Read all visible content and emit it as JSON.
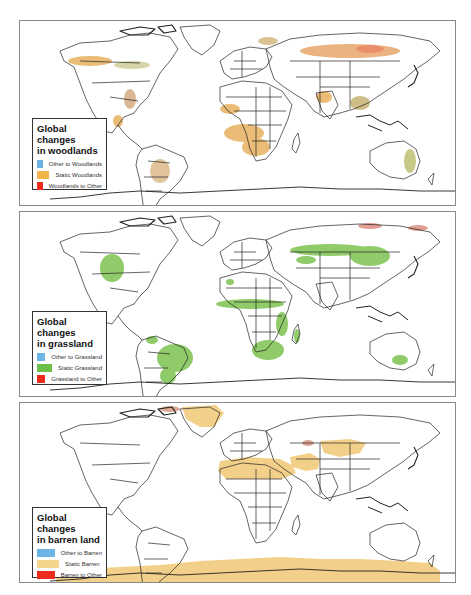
{
  "figure": {
    "panels": [
      {
        "id": "woodlands",
        "legend": {
          "title_line1": "Global changes",
          "title_line2": "in woodlands",
          "items": [
            {
              "label": "Other to Woodlands",
              "color": "#6cb4e4"
            },
            {
              "label": "Static Woodlands",
              "color": "#f0b44a"
            },
            {
              "label": "Woodlands to Other",
              "color": "#ec2b1c"
            }
          ]
        },
        "highlight_color": "#e3a64a"
      },
      {
        "id": "grassland",
        "legend": {
          "title_line1": "Global changes",
          "title_line2": "in grassland",
          "items": [
            {
              "label": "Other to Grassland",
              "color": "#6cb4e4"
            },
            {
              "label": "Static Grassland",
              "color": "#6cc04a"
            },
            {
              "label": "Grassland to Other",
              "color": "#ec2b1c"
            }
          ]
        },
        "highlight_color": "#7cc250"
      },
      {
        "id": "barren",
        "legend": {
          "title_line1": "Global changes",
          "title_line2": "in barren land",
          "items": [
            {
              "label": "Other to Barren",
              "color": "#6cb4e4"
            },
            {
              "label": "Static Barren",
              "color": "#f5d48c"
            },
            {
              "label": "Barren to Other",
              "color": "#ec2b1c"
            }
          ]
        },
        "highlight_color": "#f3d08a"
      }
    ]
  }
}
